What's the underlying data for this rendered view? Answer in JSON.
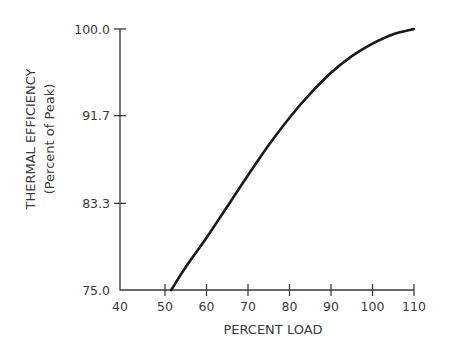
{
  "chart_data": {
    "type": "line",
    "title": "",
    "xlabel": "PERCENT LOAD",
    "ylabel": "THERMAL EFFICIENCY",
    "ylabel_sub": "(Percent of Peak)",
    "xlim": [
      40,
      110
    ],
    "ylim": [
      75.0,
      100.0
    ],
    "x_ticks": [
      40,
      50,
      60,
      70,
      80,
      90,
      100,
      110
    ],
    "x_tick_labels": [
      "40",
      "50",
      "60",
      "70",
      "80",
      "90",
      "100",
      "110"
    ],
    "y_ticks": [
      75.0,
      83.3,
      91.7,
      100.0
    ],
    "y_tick_labels": [
      "75.0",
      "83.3",
      "91.7",
      "100.0"
    ],
    "grid": false,
    "legend": null,
    "series": [
      {
        "name": "Thermal efficiency",
        "color": "#1a1a1a",
        "x": [
          51.5,
          55,
          60,
          65,
          70,
          75,
          80,
          85,
          90,
          95,
          100,
          105,
          110
        ],
        "y": [
          75.0,
          77.2,
          80.0,
          83.0,
          86.0,
          88.9,
          91.5,
          93.8,
          95.8,
          97.4,
          98.6,
          99.5,
          100.0
        ]
      }
    ]
  }
}
